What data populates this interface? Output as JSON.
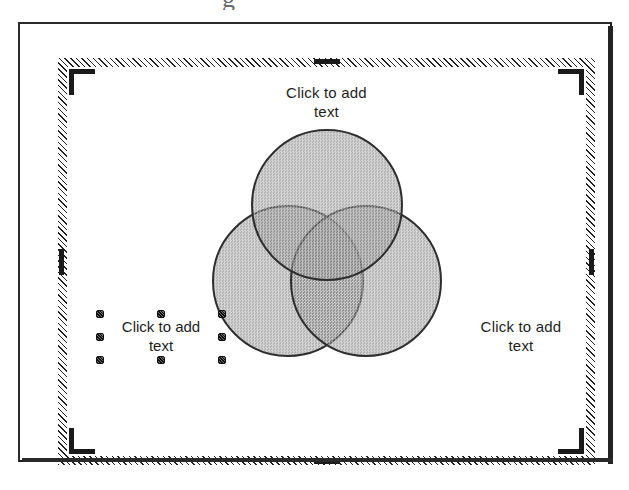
{
  "window": {
    "title": "Slide Editor",
    "scan_artifact_glyph": "g"
  },
  "slide": {
    "layout_name": "Venn Diagram Placeholder",
    "placeholders": {
      "top": {
        "text": "Click to add\ntext",
        "selected": false
      },
      "left": {
        "text": "Click to add\ntext",
        "selected": true
      },
      "right": {
        "text": "Click to add\ntext",
        "selected": false
      }
    },
    "corner_markers": [
      {
        "name": "top-left"
      },
      {
        "name": "top-right"
      },
      {
        "name": "bottom-left"
      },
      {
        "name": "bottom-right"
      }
    ],
    "edge_ticks": [
      {
        "name": "top"
      },
      {
        "name": "bottom"
      },
      {
        "name": "left"
      },
      {
        "name": "right"
      }
    ],
    "selection_handles": [
      {
        "name": "top-left"
      },
      {
        "name": "top-center"
      },
      {
        "name": "top-right"
      },
      {
        "name": "middle-left"
      },
      {
        "name": "middle-right"
      },
      {
        "name": "bottom-left"
      },
      {
        "name": "bottom-center"
      },
      {
        "name": "bottom-right"
      }
    ]
  },
  "diagram": {
    "type": "venn",
    "circle_count": 3,
    "circles": [
      {
        "name": "top",
        "label": ""
      },
      {
        "name": "left",
        "label": ""
      },
      {
        "name": "right",
        "label": ""
      }
    ],
    "colors": {
      "fill": "#8a8a8a",
      "outline": "#2e2e2e",
      "canvas": "#ffffff",
      "selection_border": "#1f1f1f",
      "marker": "#1a1a1a"
    }
  }
}
